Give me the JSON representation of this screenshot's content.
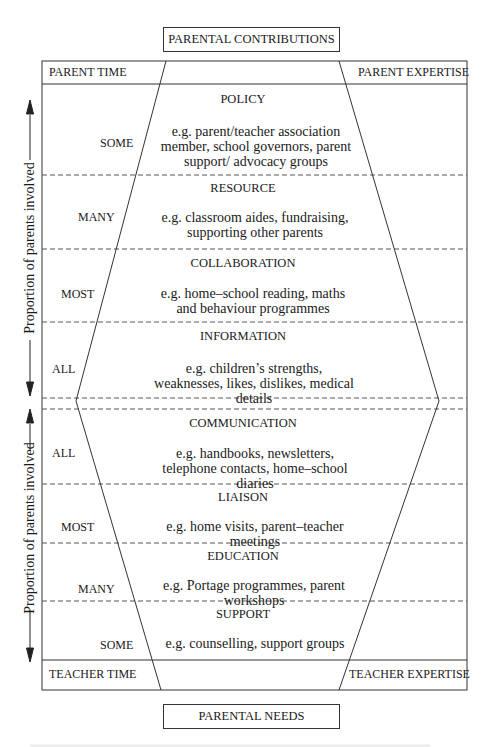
{
  "diagram": {
    "top_box": {
      "label": "PARENTAL CONTRIBUTIONS"
    },
    "bottom_box": {
      "label": "PARENTAL NEEDS"
    },
    "corners": {
      "top_left": "PARENT TIME",
      "top_right": "PARENT EXPERTISE",
      "bottom_left": "TEACHER TIME",
      "bottom_right": "TEACHER EXPERTISE"
    },
    "axis": {
      "upper_label": "Proportion of parents involved",
      "lower_label": "Proportion of parents involved"
    },
    "upper_sections": [
      {
        "level": "SOME",
        "title": "POLICY",
        "example": "e.g. parent/teacher association member, school governors, parent support/ advocacy groups"
      },
      {
        "level": "MANY",
        "title": "RESOURCE",
        "example": "e.g. classroom aides, fundraising, supporting other parents"
      },
      {
        "level": "MOST",
        "title": "COLLABORATION",
        "example": "e.g. home–school reading, maths and behaviour programmes"
      },
      {
        "level": "ALL",
        "title": "INFORMATION",
        "example": "e.g. children’s strengths, weaknesses, likes, dislikes, medical details"
      }
    ],
    "lower_sections": [
      {
        "level": "ALL",
        "title": "COMMUNICATION",
        "example": "e.g. handbooks, newsletters, telephone contacts, home–school diaries"
      },
      {
        "level": "MOST",
        "title": "LIAISON",
        "example": "e.g. home visits, parent–teacher meetings"
      },
      {
        "level": "MANY",
        "title": "EDUCATION",
        "example": "e.g. Portage programmes, parent workshops"
      },
      {
        "level": "SOME",
        "title": "SUPPORT",
        "example": "e.g. counselling, support groups"
      }
    ]
  },
  "colors": {
    "line": "#333333",
    "dash": "#555555",
    "text": "#1a1a1a"
  }
}
